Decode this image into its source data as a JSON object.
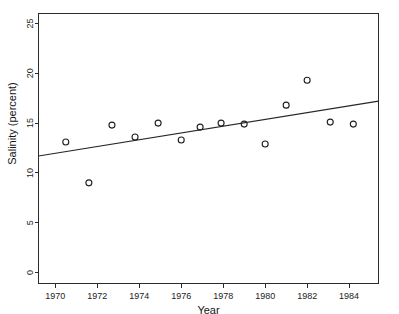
{
  "figure": {
    "cut_off_title": "",
    "background_color": "#ffffff",
    "line_color": "#262626",
    "marker_color": "#1f1f1f",
    "axis_color": "#2b2b2b"
  },
  "chart_data": {
    "type": "scatter",
    "title": "",
    "xlabel": "Year",
    "ylabel": "Salinity (percent)",
    "xlim": [
      1969.2,
      1985.4
    ],
    "ylim": [
      -1.1,
      26.0
    ],
    "xticks": [
      1970,
      1972,
      1974,
      1976,
      1978,
      1980,
      1982,
      1984
    ],
    "xticklabels": [
      "1970",
      "1972",
      "1974",
      "1976",
      "1978",
      "1980",
      "1982",
      "1984"
    ],
    "yticks": [
      0,
      5,
      10,
      15,
      20,
      25
    ],
    "yticklabels": [
      "0",
      "5",
      "10",
      "15",
      "20",
      "25"
    ],
    "grid": false,
    "legend": null,
    "marker": "open-circle",
    "x": [
      1970.5,
      1971.6,
      1972.7,
      1973.8,
      1974.9,
      1976.0,
      1976.9,
      1977.9,
      1979.0,
      1980.0,
      1981.0,
      1982.0,
      1983.1,
      1984.2
    ],
    "y": [
      13.1,
      9.0,
      14.8,
      13.6,
      15.0,
      13.3,
      14.6,
      15.0,
      14.9,
      12.9,
      16.8,
      19.3,
      15.1,
      14.9
    ],
    "points": [
      {
        "year": 1970.5,
        "salinity": 13.1
      },
      {
        "year": 1971.6,
        "salinity": 9.0
      },
      {
        "year": 1972.7,
        "salinity": 14.8
      },
      {
        "year": 1973.8,
        "salinity": 13.6
      },
      {
        "year": 1974.9,
        "salinity": 15.0
      },
      {
        "year": 1976.0,
        "salinity": 13.3
      },
      {
        "year": 1976.9,
        "salinity": 14.6
      },
      {
        "year": 1977.9,
        "salinity": 15.0
      },
      {
        "year": 1979.0,
        "salinity": 14.9
      },
      {
        "year": 1980.0,
        "salinity": 12.9
      },
      {
        "year": 1981.0,
        "salinity": 16.8
      },
      {
        "year": 1982.0,
        "salinity": 19.3
      },
      {
        "year": 1983.1,
        "salinity": 15.1
      },
      {
        "year": 1984.2,
        "salinity": 14.9
      }
    ],
    "series": [
      {
        "name": "Salinity observations",
        "type": "scatter",
        "values": [
          13.1,
          9.0,
          14.8,
          13.6,
          15.0,
          13.3,
          14.6,
          15.0,
          14.9,
          12.9,
          16.8,
          19.3,
          15.1,
          14.9
        ]
      },
      {
        "name": "Fitted trend line",
        "type": "line",
        "endpoints": [
          {
            "year": 1969.2,
            "salinity": 11.7
          },
          {
            "year": 1985.4,
            "salinity": 17.2
          }
        ]
      }
    ],
    "trendline": {
      "x_start": 1969.2,
      "y_start": 11.7,
      "x_end": 1985.4,
      "y_end": 17.2
    }
  }
}
